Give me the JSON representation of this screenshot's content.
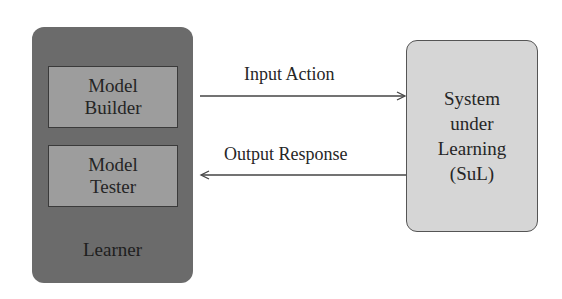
{
  "diagram": {
    "learner": {
      "label": "Learner",
      "color": "#6b6b6b",
      "components": [
        {
          "line1": "Model",
          "line2": "Builder"
        },
        {
          "line1": "Model",
          "line2": "Tester"
        }
      ],
      "component_color": "#9d9d9d"
    },
    "sul": {
      "lines": [
        "System",
        "under",
        "Learning",
        "(SuL)"
      ],
      "color": "#d6d6d6"
    },
    "edges": [
      {
        "label": "Input Action",
        "from": "Learner",
        "to": "System under Learning (SuL)"
      },
      {
        "label": "Output Response",
        "from": "System under Learning (SuL)",
        "to": "Learner"
      }
    ]
  }
}
